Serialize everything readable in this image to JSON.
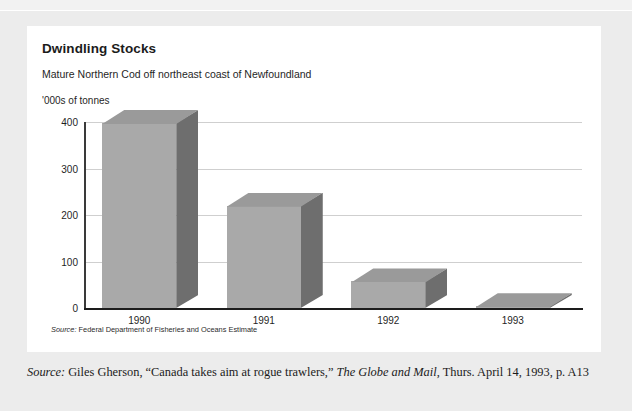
{
  "card": {
    "title": "Dwindling Stocks",
    "subtitle": "Mature Northern Cod off northeast coast of Newfoundland",
    "unit_label": "'000s of tonnes",
    "source_prefix": "Source:",
    "source_text": " Federal Department of Fisheries and Oceans Estimate"
  },
  "outer_caption": {
    "source_prefix": "Source:",
    "part1": " Giles Gherson, “Canada takes aim at rogue trawlers,” ",
    "publication": "The Globe and Mail",
    "part2": ", Thurs. April 14, 1993, p. A13"
  },
  "colors": {
    "bar_front": "#a9a9a9",
    "bar_side": "#6e6e6e",
    "bar_top": "#9a9a9a",
    "gridline": "#cfcfcf",
    "axis": "#1d1d1d",
    "card_background": "#ffffff",
    "page_background": "#ececec"
  },
  "chart_data": {
    "type": "bar",
    "title": "Dwindling Stocks",
    "subtitle": "Mature Northern Cod off northeast coast of Newfoundland",
    "xlabel": "",
    "ylabel": "'000s of tonnes",
    "categories": [
      "1990",
      "1991",
      "1992",
      "1993"
    ],
    "values": [
      398,
      220,
      57,
      4
    ],
    "ylim": [
      0,
      400
    ],
    "yticks": [
      0,
      100,
      200,
      300,
      400
    ],
    "ytick_labels": [
      "0",
      "100",
      "200",
      "300",
      "400"
    ],
    "grid": true,
    "legend": false,
    "style": "3d-bar",
    "source": "Federal Department of Fisheries and Oceans Estimate"
  }
}
